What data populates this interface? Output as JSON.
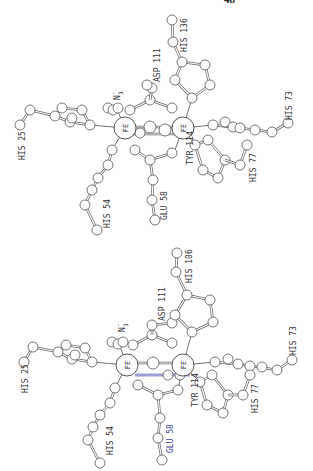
{
  "page": {
    "number": "48"
  },
  "figure": {
    "orientation": "rotated 90° counter-clockwise",
    "panels": [
      {
        "id": "top",
        "metal_labels": [
          "FE",
          "FE"
        ],
        "ligand_label": "N3-",
        "ligand_main": "N",
        "ligand_sub": "3",
        "ligand_sup": "-",
        "residues": {
          "his_25": "HIS 25",
          "his_54": "HIS 54",
          "glu_58": "GLU 58",
          "his_73": "HIS 73",
          "his_77": "HIS 77",
          "asp_111": "ASP 111",
          "tyr_114": "TYR 114",
          "his_106": "HIS 136"
        }
      },
      {
        "id": "bottom",
        "metal_labels": [
          "FE",
          "FE"
        ],
        "ligand_label": "N3-",
        "ligand_main": "N",
        "ligand_sub": "3",
        "ligand_sup": "-",
        "residues": {
          "his_25": "HIS 25",
          "his_54": "HIS 54",
          "glu_58": "GLU 58",
          "his_73": "HIS 73",
          "his_77": "HIS 77",
          "asp_111": "ASP 111",
          "tyr_114": "TYR 114",
          "his_106": "HIS 106"
        },
        "highlight_color": "#3a3fa0"
      }
    ]
  }
}
